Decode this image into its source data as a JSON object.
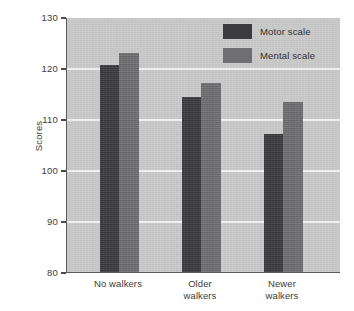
{
  "chart_data": {
    "type": "bar",
    "title": "",
    "xlabel": "",
    "ylabel": "Scores",
    "ylim": [
      80,
      130
    ],
    "yticks": [
      80,
      90,
      100,
      110,
      120,
      130
    ],
    "ytick_labels": [
      "80",
      "90",
      "100",
      "110",
      "120",
      "130"
    ],
    "grid": "horizontal white gridlines at 90, 100, 110, 120",
    "legend_position": "top-right inside plot area",
    "categories": [
      "No walkers",
      "Older walkers",
      "Newer walkers"
    ],
    "category_labels_wrapped": [
      "No walkers",
      "Older\nwalkers",
      "Newer\nwalkers"
    ],
    "series": [
      {
        "name": "Motor scale",
        "color": "#3b3b3d",
        "values": [
          120.5,
          114.3,
          107.0
        ]
      },
      {
        "name": "Mental scale",
        "color": "#6f6f71",
        "values": [
          123.0,
          117.0,
          113.3
        ]
      }
    ]
  },
  "legend": {
    "items": [
      {
        "label": "Motor scale",
        "swatch": "motor"
      },
      {
        "label": "Mental scale",
        "swatch": "mental"
      }
    ]
  },
  "colors": {
    "plot_background": "#cbcbcb",
    "figure_background": "#ffffff",
    "gridline": "#f4f4f4",
    "axis": "#5a5a5a",
    "motor_scale": "#3b3b3d",
    "mental_scale": "#6f6f71",
    "text": "#3d3d3d"
  }
}
